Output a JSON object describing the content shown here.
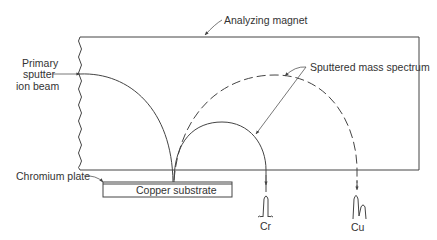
{
  "diagram": {
    "type": "schematic",
    "labels": {
      "magnet": "Analyzing magnet",
      "primary_line1": "Primary",
      "primary_line2": "sputter",
      "primary_line3": "ion beam",
      "spectrum": "Sputtered mass spectrum",
      "chromium": "Chromium plate",
      "substrate": "Copper substrate",
      "peak_cr": "Cr",
      "peak_cu": "Cu"
    },
    "components": [
      {
        "id": "magnet-region",
        "shape": "rectangle",
        "left_edge": "wavy"
      },
      {
        "id": "primary-beam",
        "shape": "arc",
        "style": "solid",
        "from": "left edge",
        "to": "substrate"
      },
      {
        "id": "cr-trajectory",
        "shape": "arc",
        "style": "solid",
        "to": "Cr detector"
      },
      {
        "id": "cu-trajectory",
        "shape": "arc",
        "style": "dashed",
        "to": "Cu detector"
      },
      {
        "id": "substrate",
        "shape": "rectangle"
      },
      {
        "id": "cr-peak",
        "shape": "single peak"
      },
      {
        "id": "cu-peak",
        "shape": "double peak"
      }
    ],
    "colors": {
      "line": "#444444",
      "text": "#333333",
      "background": "#ffffff"
    }
  }
}
